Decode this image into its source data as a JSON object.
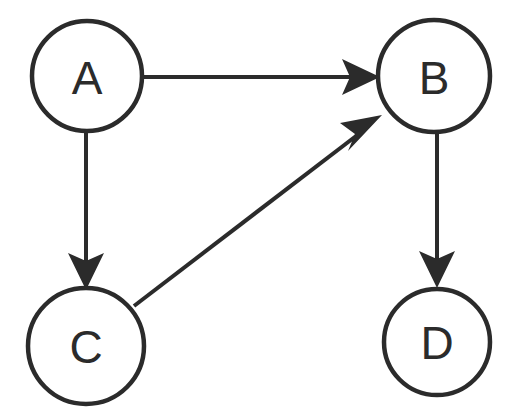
{
  "diagram": {
    "type": "directed-graph",
    "title": "",
    "background_color": "#ffffff",
    "stroke_color": "#2b2b2b",
    "node_fill_color": "#ffffff",
    "nodes": [
      {
        "id": "A",
        "label": "A",
        "cx": 87,
        "cy": 76,
        "r": 55
      },
      {
        "id": "B",
        "label": "B",
        "cx": 434,
        "cy": 76,
        "r": 56
      },
      {
        "id": "C",
        "label": "C",
        "cx": 86,
        "cy": 346,
        "r": 58
      },
      {
        "id": "D",
        "label": "D",
        "cx": 437,
        "cy": 342,
        "r": 53
      }
    ],
    "edges": [
      {
        "id": "A-B",
        "from": "A",
        "to": "B",
        "label": "",
        "directed": true
      },
      {
        "id": "A-C",
        "from": "A",
        "to": "C",
        "label": "",
        "directed": true
      },
      {
        "id": "C-B",
        "from": "C",
        "to": "B",
        "label": "",
        "directed": true
      },
      {
        "id": "B-D",
        "from": "B",
        "to": "D",
        "label": "",
        "directed": true
      }
    ]
  }
}
